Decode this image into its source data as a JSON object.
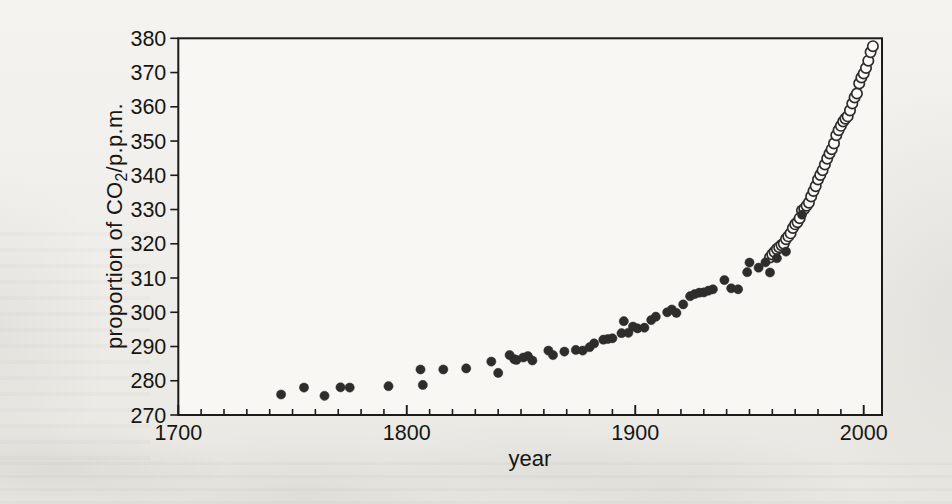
{
  "figure": {
    "kind": "scanned textbook scatter plot",
    "xlabel": "year",
    "ylabel_pre": "proportion of CO",
    "ylabel_sub": "2",
    "ylabel_post": "/p.p.m."
  },
  "chart_data": {
    "type": "scatter",
    "title": "",
    "xlabel": "year",
    "ylabel": "proportion of CO2/p.p.m.",
    "xlim": [
      1700,
      2008
    ],
    "ylim": [
      270,
      380
    ],
    "xticks_major": [
      1700,
      1800,
      1900,
      2000
    ],
    "xtick_minor_step": 10,
    "yticks": [
      270,
      280,
      290,
      300,
      310,
      320,
      330,
      340,
      350,
      360,
      370,
      380
    ],
    "grid": false,
    "legend_position": "none",
    "colors": {
      "axis": "#1b1b19",
      "marker_dark": "#2e2d2b",
      "open_fill": "#fbfaf7",
      "plot_bg": "#f8f7f3"
    },
    "series": [
      {
        "name": "annual mean (open circles)",
        "marker": "open-circle",
        "points": [
          [
            1959,
            315.98
          ],
          [
            1960,
            316.91
          ],
          [
            1961,
            317.64
          ],
          [
            1962,
            318.45
          ],
          [
            1963,
            318.99
          ],
          [
            1964,
            319.62
          ],
          [
            1965,
            320.04
          ],
          [
            1966,
            321.37
          ],
          [
            1967,
            322.18
          ],
          [
            1968,
            323.05
          ],
          [
            1969,
            324.62
          ],
          [
            1970,
            325.68
          ],
          [
            1971,
            326.32
          ],
          [
            1972,
            327.46
          ],
          [
            1973,
            329.68
          ],
          [
            1974,
            330.19
          ],
          [
            1975,
            331.12
          ],
          [
            1976,
            332.03
          ],
          [
            1977,
            333.84
          ],
          [
            1978,
            335.41
          ],
          [
            1979,
            336.84
          ],
          [
            1980,
            338.76
          ],
          [
            1981,
            340.12
          ],
          [
            1982,
            341.48
          ],
          [
            1983,
            343.15
          ],
          [
            1984,
            344.87
          ],
          [
            1985,
            346.35
          ],
          [
            1986,
            347.61
          ],
          [
            1987,
            349.31
          ],
          [
            1988,
            351.69
          ],
          [
            1989,
            353.2
          ],
          [
            1990,
            354.45
          ],
          [
            1991,
            355.7
          ],
          [
            1992,
            356.54
          ],
          [
            1993,
            357.21
          ],
          [
            1994,
            358.96
          ],
          [
            1995,
            360.97
          ],
          [
            1996,
            362.74
          ],
          [
            1997,
            363.88
          ],
          [
            1998,
            366.84
          ],
          [
            1999,
            368.54
          ],
          [
            2000,
            369.71
          ],
          [
            2001,
            371.32
          ],
          [
            2002,
            373.45
          ],
          [
            2003,
            375.98
          ],
          [
            2004,
            377.7
          ]
        ]
      },
      {
        "name": "ice-core record (filled circles)",
        "marker": "filled-circle",
        "points": [
          [
            1745,
            276.0
          ],
          [
            1755,
            278.0
          ],
          [
            1764,
            275.6
          ],
          [
            1771,
            278.1
          ],
          [
            1775,
            278.0
          ],
          [
            1792,
            278.4
          ],
          [
            1806,
            283.3
          ],
          [
            1807,
            278.8
          ],
          [
            1816,
            283.3
          ],
          [
            1826,
            283.6
          ],
          [
            1837,
            285.6
          ],
          [
            1840,
            282.3
          ],
          [
            1845,
            287.5
          ],
          [
            1847,
            286.3
          ],
          [
            1848,
            286.1
          ],
          [
            1851,
            286.8
          ],
          [
            1853,
            287.2
          ],
          [
            1855,
            285.9
          ],
          [
            1862,
            288.8
          ],
          [
            1864,
            287.5
          ],
          [
            1869,
            288.5
          ],
          [
            1874,
            289.0
          ],
          [
            1877,
            288.8
          ],
          [
            1880,
            289.8
          ],
          [
            1882,
            290.9
          ],
          [
            1886,
            292.0
          ],
          [
            1888,
            292.2
          ],
          [
            1890,
            292.4
          ],
          [
            1894,
            293.9
          ],
          [
            1895,
            297.4
          ],
          [
            1897,
            294.0
          ],
          [
            1899,
            295.8
          ],
          [
            1901,
            295.3
          ],
          [
            1904,
            295.5
          ],
          [
            1907,
            297.7
          ],
          [
            1909,
            298.7
          ],
          [
            1914,
            300.0
          ],
          [
            1916,
            300.8
          ],
          [
            1918,
            299.8
          ],
          [
            1921,
            302.3
          ],
          [
            1924,
            304.7
          ],
          [
            1926,
            305.3
          ],
          [
            1928,
            305.7
          ],
          [
            1930,
            305.8
          ],
          [
            1932,
            306.3
          ],
          [
            1934,
            306.7
          ],
          [
            1939,
            309.4
          ],
          [
            1942,
            307.0
          ],
          [
            1945,
            306.7
          ],
          [
            1949,
            311.7
          ],
          [
            1950,
            314.5
          ],
          [
            1954,
            313.0
          ],
          [
            1957,
            314.6
          ],
          [
            1959,
            311.6
          ],
          [
            1962,
            315.8
          ],
          [
            1966,
            317.7
          ],
          [
            1973,
            328.5
          ]
        ]
      }
    ]
  }
}
